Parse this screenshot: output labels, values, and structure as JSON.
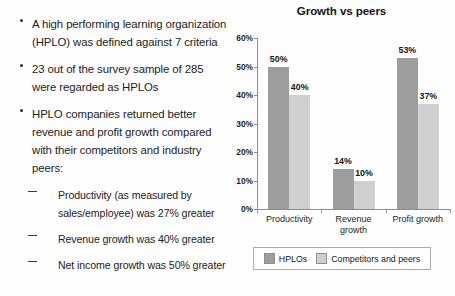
{
  "slide": {
    "bullets": [
      {
        "text": "A high performing learning organization (HPLO) was defined against 7 criteria"
      },
      {
        "text": "23 out of the survey sample of 285 were regarded as HPLOs"
      },
      {
        "text": "HPLO companies returned better revenue and profit growth compared with their competitors and industry peers:"
      }
    ],
    "sub_bullets": [
      {
        "text": "Productivity (as measured by sales/employee) was 27% greater"
      },
      {
        "text": "Revenue growth was 40% greater"
      },
      {
        "text": "Net income growth was 50% greater"
      }
    ]
  },
  "chart_data": {
    "type": "bar",
    "title": "Growth vs peers",
    "xlabel": "",
    "ylabel": "",
    "ylim": [
      0,
      60
    ],
    "grid": false,
    "legend_position": "bottom",
    "categories": [
      "Productivity",
      "Revenue growth",
      "Profit growth"
    ],
    "ytick_labels": [
      "0%",
      "10%",
      "20%",
      "30%",
      "40%",
      "50%",
      "60%"
    ],
    "ytick_values": [
      0,
      10,
      20,
      30,
      40,
      50,
      60
    ],
    "series": [
      {
        "name": "HPLOs",
        "color": "#9d9d9d",
        "values": [
          50,
          14,
          53
        ],
        "value_labels": [
          "50%",
          "14%",
          "53%"
        ]
      },
      {
        "name": "Competitors and peers",
        "color": "#cfcfcf",
        "values": [
          40,
          10,
          37
        ],
        "value_labels": [
          "40%",
          "10%",
          "37%"
        ]
      }
    ]
  }
}
